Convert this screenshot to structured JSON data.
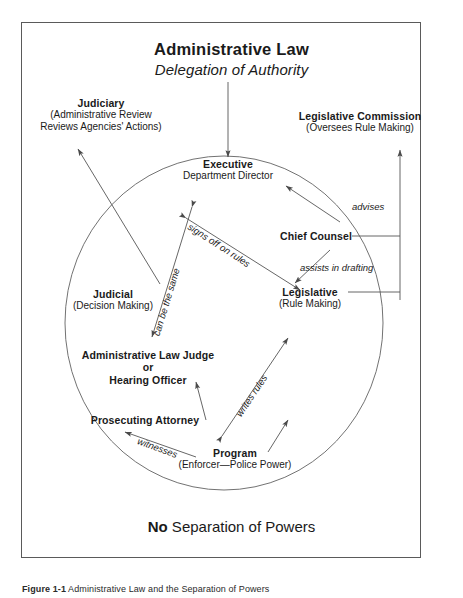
{
  "figure": {
    "title": "Administrative Law",
    "subtitle": "Delegation of Authority",
    "footer_prefix": "No",
    "footer_rest": " Separation of Powers",
    "caption_label": "Figure 1-1",
    "caption_text": " Administrative Law and the Separation of Powers",
    "border_color": "#5a5a5a",
    "line_color": "#555555",
    "text_color": "#1a1a1a"
  },
  "nodes": {
    "judiciary": {
      "title": "Judiciary",
      "line1": "(Administrative Review",
      "line2": "Reviews Agencies' Actions)"
    },
    "legislative_commission": {
      "title": "Legislative Commission",
      "line1": "(Oversees Rule Making)"
    },
    "executive": {
      "title": "Executive",
      "line1": "Department Director"
    },
    "chief_counsel": {
      "title": "Chief Counsel"
    },
    "legislative": {
      "title": "Legislative",
      "line1": "(Rule Making)"
    },
    "judicial": {
      "title": "Judicial",
      "line1": "(Decision Making)"
    },
    "alj": {
      "title": "Administrative Law Judge",
      "line1": "or",
      "line2": "Hearing Officer"
    },
    "prosecuting_attorney": {
      "title": "Prosecuting Attorney"
    },
    "program": {
      "title": "Program",
      "line1": "(Enforcer—Police Power)"
    }
  },
  "edge_labels": {
    "advises": "advises",
    "assists_in_drafting": "assists in drafting",
    "signs_off_on_rules": "signs off on rules",
    "can_be_the_same": "can be the same",
    "writes_rules": "writes rules",
    "witnesses": "witnesses"
  }
}
